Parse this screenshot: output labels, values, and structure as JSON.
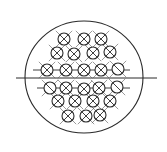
{
  "diagram": {
    "type": "tube-sheet-layout",
    "canvas": {
      "width": 167,
      "height": 152,
      "background": "#ffffff"
    },
    "colors": {
      "line": "#2a2a2a",
      "fin": "#555555"
    },
    "shell": {
      "cx": 84,
      "cy": 77,
      "rx": 59,
      "ry": 56
    },
    "center_line": {
      "x1": 16,
      "x2": 157,
      "y": 78
    },
    "partition_lines": [
      {
        "x1": 33,
        "x2": 130,
        "y": 70
      },
      {
        "x1": 37,
        "x2": 130,
        "y": 88
      }
    ],
    "tube_radius": 6,
    "tubes": [
      {
        "x": 64,
        "y": 39,
        "mark": "x"
      },
      {
        "x": 84,
        "y": 39,
        "mark": "x"
      },
      {
        "x": 101,
        "y": 39,
        "mark": "x"
      },
      {
        "x": 57,
        "y": 53,
        "mark": "x"
      },
      {
        "x": 74,
        "y": 54,
        "mark": "x"
      },
      {
        "x": 93,
        "y": 53,
        "mark": "x"
      },
      {
        "x": 110,
        "y": 52,
        "mark": "x"
      },
      {
        "x": 47,
        "y": 70,
        "mark": "x"
      },
      {
        "x": 66,
        "y": 70,
        "mark": "x"
      },
      {
        "x": 84,
        "y": 70,
        "mark": "x"
      },
      {
        "x": 101,
        "y": 70,
        "mark": "x"
      },
      {
        "x": 118,
        "y": 69,
        "mark": "slash"
      },
      {
        "x": 50,
        "y": 88,
        "mark": "slash"
      },
      {
        "x": 66,
        "y": 88,
        "mark": "x"
      },
      {
        "x": 84,
        "y": 89,
        "mark": "x"
      },
      {
        "x": 99,
        "y": 88,
        "mark": "x"
      },
      {
        "x": 117,
        "y": 87,
        "mark": "slash"
      },
      {
        "x": 58,
        "y": 101,
        "mark": "x"
      },
      {
        "x": 75,
        "y": 101,
        "mark": "x"
      },
      {
        "x": 93,
        "y": 101,
        "mark": "x"
      },
      {
        "x": 110,
        "y": 101,
        "mark": "x"
      },
      {
        "x": 68,
        "y": 116,
        "mark": "x"
      },
      {
        "x": 86,
        "y": 116,
        "mark": "x"
      },
      {
        "x": 100,
        "y": 115,
        "mark": "x"
      }
    ]
  }
}
